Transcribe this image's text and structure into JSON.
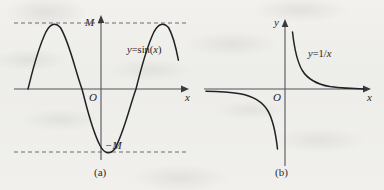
{
  "figure": {
    "background_color": "#f0efec",
    "ink_color": "#26262a",
    "axis_color": "#55555a",
    "dash_color": "#6b6b70",
    "panels": [
      {
        "id": "a",
        "caption": "(a)",
        "curve_label": "y=sin(x)",
        "curve_label_parts": {
          "y": "y",
          "eq": "=sin(",
          "x": "x",
          "close": ")"
        },
        "axis_x_label": "x",
        "axis_y_label": "",
        "origin_label": "O",
        "gridline_labels": {
          "upper": "M",
          "lower": "−M"
        },
        "function": "sin",
        "amplitude_label": "M",
        "periods_shown": 2,
        "asymptote_lines": [
          "y = M",
          "y = −M"
        ]
      },
      {
        "id": "b",
        "caption": "(b)",
        "curve_label": "y=1/x",
        "curve_label_parts": {
          "y": "y",
          "eq": "=1/",
          "x": "x",
          "close": ""
        },
        "axis_x_label": "x",
        "axis_y_label": "y",
        "origin_label": "O",
        "gridline_labels": {
          "upper": "",
          "lower": ""
        },
        "function": "reciprocal",
        "amplitude_label": "",
        "periods_shown": 0,
        "asymptote_lines": []
      }
    ]
  }
}
